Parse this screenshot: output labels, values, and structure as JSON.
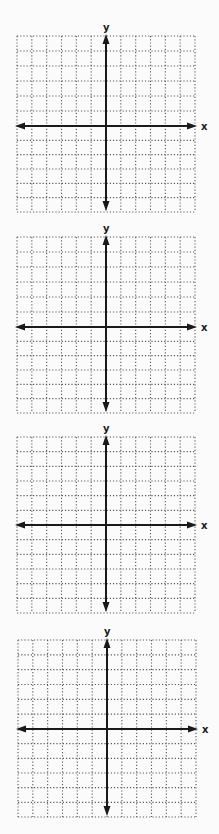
{
  "worksheet": {
    "title": "",
    "colors": {
      "background": "#fbfbfb",
      "axis": "#1a1a1a",
      "grid_dots": "#5a5a5a"
    },
    "grid": {
      "columns": 12,
      "rows": 12,
      "x_min": -6,
      "x_max": 6,
      "y_min": -6,
      "y_max": 6,
      "cell_px": 14.8
    },
    "planes": [
      {
        "id": 1,
        "x_label": "x",
        "y_label": "y",
        "top": 36,
        "axis_y": 126,
        "bottom": 212,
        "left": 17,
        "right": 195,
        "axis_x": 106
      },
      {
        "id": 2,
        "x_label": "x",
        "y_label": "y",
        "top": 237,
        "axis_y": 327,
        "bottom": 413,
        "left": 17,
        "right": 195,
        "axis_x": 106
      },
      {
        "id": 3,
        "x_label": "x",
        "y_label": "y",
        "top": 437,
        "axis_y": 525,
        "bottom": 613,
        "left": 17,
        "right": 195,
        "axis_x": 106
      },
      {
        "id": 4,
        "x_label": "x",
        "y_label": "y",
        "top": 640,
        "axis_y": 729,
        "bottom": 817,
        "left": 18,
        "right": 196,
        "axis_x": 107
      }
    ]
  }
}
